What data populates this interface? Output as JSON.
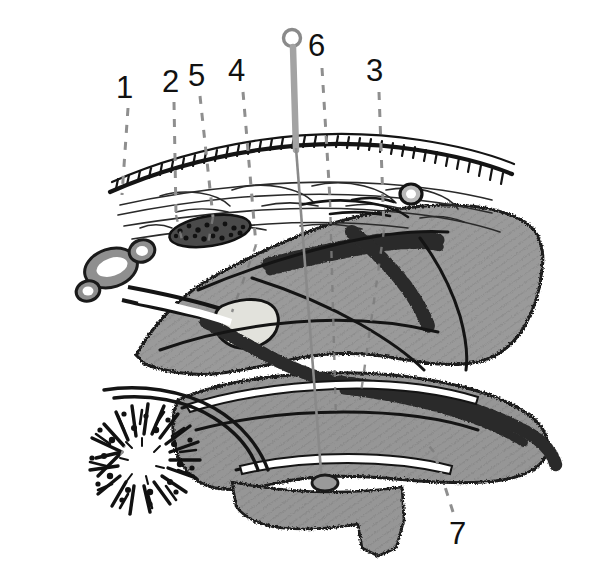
{
  "figure": {
    "background_color": "#ffffff",
    "width": 592,
    "height": 588
  },
  "palette": {
    "tissue_gray": "#969696",
    "tissue_gray_dark": "#8a8a8a",
    "hatch_line": "#8d8d8d",
    "ink": "#111111",
    "outline": "#1a1a1a",
    "leader_gray": "#8f8f8f",
    "pin_gray": "#9b9b9b",
    "pale_cream": "#e2e2dc",
    "white": "#ffffff"
  },
  "labels": [
    {
      "id": "label-1",
      "text": "1",
      "x": 116,
      "y": 72,
      "leader": {
        "x1": 128,
        "y1": 108,
        "x2": 122,
        "y2": 195
      }
    },
    {
      "id": "label-2",
      "text": "2",
      "x": 162,
      "y": 66,
      "leader": {
        "x1": 174,
        "y1": 102,
        "x2": 176,
        "y2": 215
      }
    },
    {
      "id": "label-3",
      "text": "3",
      "x": 366,
      "y": 55,
      "leader": {
        "x1": 379,
        "y1": 92,
        "x2": 384,
        "y2": 230
      }
    },
    {
      "id": "label-4",
      "text": "4",
      "x": 228,
      "y": 55,
      "leader": {
        "x1": 243,
        "y1": 92,
        "x2": 256,
        "y2": 245
      }
    },
    {
      "id": "label-5",
      "text": "5",
      "x": 188,
      "y": 60,
      "leader": {
        "x1": 200,
        "y1": 96,
        "x2": 213,
        "y2": 217
      }
    },
    {
      "id": "label-6",
      "text": "6",
      "x": 308,
      "y": 30,
      "leader": {
        "x1": 322,
        "y1": 68,
        "x2": 330,
        "y2": 200
      }
    },
    {
      "id": "label-7",
      "text": "7",
      "x": 449,
      "y": 518,
      "leader": {
        "x1": 453,
        "y1": 512,
        "x2": 434,
        "y2": 452
      }
    }
  ],
  "annotations": {
    "pin": {
      "name": "probe-pin",
      "head_center_x": 292,
      "head_center_y": 38,
      "head_radius": 8,
      "shaft_top_y": 46,
      "shaft_taper_y": 150,
      "shaft_bottom_y": 488,
      "entry_oval_x": 325,
      "entry_oval_y": 483
    },
    "structures": [
      {
        "name": "surface-membrane-with-palisade",
        "description": "arched surface layer bearing regular comb-like tick marks"
      },
      {
        "name": "wispy-fiber-layer",
        "description": "loose cloud-like fibrous band beneath the surface membrane"
      },
      {
        "name": "upper-stippled-nodule",
        "description": "dark granular oval mass at upper left of the tissue body"
      },
      {
        "name": "bulb-cluster",
        "description": "three outlined bulbous vesicles on the left margin"
      },
      {
        "name": "pale-teardrop-body",
        "description": "pale cream teardrop inclusion in the mid tissue"
      },
      {
        "name": "granular-band-upper",
        "description": "stippled band sweeping across the upper tissue mass"
      },
      {
        "name": "granular-band-lower",
        "description": "stippled band along the lower tissue mass"
      },
      {
        "name": "radial-stellate-body",
        "description": "dense radiating stellate structure at lower left"
      },
      {
        "name": "small-ring-nodule",
        "description": "small ring nodule on the right of the membrane"
      },
      {
        "name": "lower-tissue-lobe",
        "description": "lower gray lobe with pointed inferior projection"
      }
    ]
  }
}
